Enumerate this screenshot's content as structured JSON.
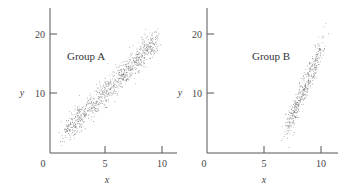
{
  "chart_data": [
    {
      "type": "scatter",
      "title": "",
      "annotation": "Group A",
      "xlabel": "x",
      "ylabel": "y",
      "xlim": [
        0,
        11
      ],
      "ylim": [
        0,
        24
      ],
      "xticks": [
        "0",
        "5",
        "10"
      ],
      "yticks": [
        "10",
        "20"
      ],
      "grid": false,
      "distribution": {
        "n": 900,
        "x_range": [
          1.5,
          9.5
        ],
        "slope": 1.95,
        "intercept": 0.5,
        "spread": 1.9,
        "description": "Elongated positively correlated cloud from about (1.5, 2) to (9.5, 18)"
      }
    },
    {
      "type": "scatter",
      "title": "",
      "annotation": "Group B",
      "xlabel": "x",
      "ylabel": "y",
      "xlim": [
        0,
        11
      ],
      "ylim": [
        0,
        24
      ],
      "xticks": [
        "0",
        "5",
        "10"
      ],
      "yticks": [
        "10",
        "20"
      ],
      "grid": false,
      "distribution": {
        "n": 450,
        "x_range": [
          7.0,
          10.0
        ],
        "slope": 4.4,
        "intercept": -26.5,
        "spread": 2.2,
        "description": "Steep positively correlated cloud from about (7, 6) to (10, 20)"
      }
    }
  ],
  "panels": [
    {
      "group_label": "Group A",
      "x_label": "x",
      "y_label": "y",
      "x_ticks": [
        "0",
        "5",
        "10"
      ],
      "y_ticks": [
        "20",
        "10"
      ]
    },
    {
      "group_label": "Group B",
      "x_label": "x",
      "y_label": "y",
      "x_ticks": [
        "0",
        "5",
        "10"
      ],
      "y_ticks": [
        "20",
        "10"
      ]
    }
  ]
}
